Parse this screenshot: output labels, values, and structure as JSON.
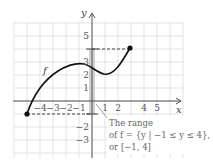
{
  "figure": {
    "axis_labels": {
      "x": "x",
      "y": "y"
    },
    "x_ticks": [
      {
        "value": -4,
        "label": "−4"
      },
      {
        "value": -3,
        "label": "−3"
      },
      {
        "value": -2,
        "label": "−2"
      },
      {
        "value": -1,
        "label": "−1"
      },
      {
        "value": 1,
        "label": "1"
      },
      {
        "value": 2,
        "label": "2"
      },
      {
        "value": 4,
        "label": "4"
      },
      {
        "value": 5,
        "label": "5"
      }
    ],
    "y_ticks": [
      {
        "value": 5,
        "label": "5"
      },
      {
        "value": 3,
        "label": "3"
      },
      {
        "value": 2,
        "label": "2"
      },
      {
        "value": 1,
        "label": "1"
      },
      {
        "value": -2,
        "label": "−2"
      },
      {
        "value": -3,
        "label": "−3"
      }
    ],
    "function_label": "f",
    "curve_points": [
      [
        -4.5,
        -1
      ],
      [
        -4,
        0.3
      ],
      [
        -3,
        1.8
      ],
      [
        -2,
        2.55
      ],
      [
        -1,
        2.78
      ],
      [
        0,
        2.4
      ],
      [
        1,
        2
      ],
      [
        2,
        2.6
      ],
      [
        3,
        4
      ]
    ],
    "endpoints": [
      {
        "x": -4.5,
        "y": -1
      },
      {
        "x": 3,
        "y": 4
      }
    ],
    "range_bar": {
      "min": -1,
      "max": 4
    },
    "annotation": {
      "line1": "The range",
      "line2": "of f = {y | −1 ≤ y ≤ 4},",
      "line3": "or [−1, 4]"
    }
  }
}
